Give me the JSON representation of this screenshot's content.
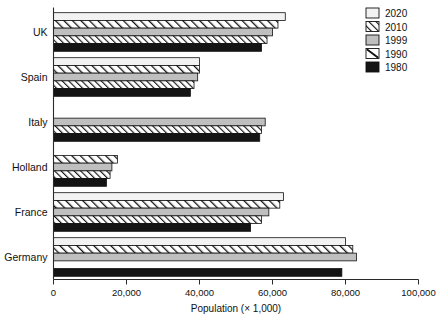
{
  "chart_data": {
    "type": "bar",
    "orientation": "horizontal",
    "title": "",
    "xlabel": "Population (× 1,000)",
    "ylabel": "",
    "xlim": [
      0,
      100000
    ],
    "xticks": [
      0,
      20000,
      40000,
      60000,
      80000,
      100000
    ],
    "xticklabels": [
      "0",
      "20,000",
      "40,000",
      "60,000",
      "80,000",
      "100,000"
    ],
    "grid": false,
    "legend_position": "top-right",
    "categories": [
      "UK",
      "Spain",
      "Italy",
      "Holland",
      "France",
      "Germany"
    ],
    "series": [
      {
        "name": "2020",
        "fill": "#f2f2f2",
        "pattern": "solid-light",
        "values": [
          63500,
          40000,
          null,
          null,
          63000,
          80000
        ]
      },
      {
        "name": "2010",
        "fill": "#ffffff",
        "pattern": "hatch-up",
        "values": [
          61500,
          40000,
          null,
          17500,
          62000,
          82000
        ]
      },
      {
        "name": "1999",
        "fill": "#bfbfbf",
        "pattern": "solid-gray",
        "values": [
          60000,
          39500,
          58000,
          16000,
          59000,
          83000
        ]
      },
      {
        "name": "1990",
        "fill": "#ffffff",
        "pattern": "hatch-up-dense",
        "values": [
          58500,
          38500,
          57000,
          15500,
          57000,
          null
        ]
      },
      {
        "name": "1980",
        "fill": "#141414",
        "pattern": "solid-black",
        "values": [
          57000,
          37500,
          56500,
          14500,
          54000,
          79000
        ]
      }
    ]
  },
  "legend": {
    "items": [
      {
        "label": "2020",
        "swatch": "solid-light"
      },
      {
        "label": "2010",
        "swatch": "hatch-up"
      },
      {
        "label": "1999",
        "swatch": "solid-gray"
      },
      {
        "label": "1990",
        "swatch": "diag-single"
      },
      {
        "label": "1980",
        "swatch": "solid-black"
      }
    ]
  },
  "colors": {
    "axis": "#2a2a2a",
    "bar_outline": "#111111",
    "light_fill": "#f2f2f2",
    "gray_fill": "#bfbfbf",
    "black_fill": "#141414",
    "white_fill": "#ffffff",
    "background": "#ffffff"
  }
}
